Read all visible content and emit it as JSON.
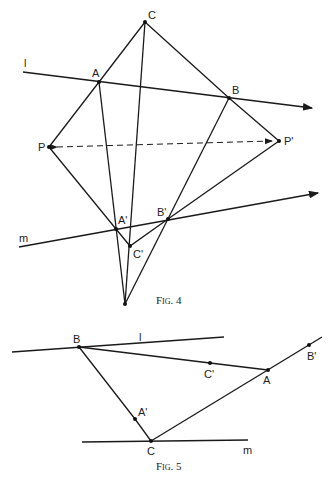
{
  "fig4": {
    "caption": "Fig. 4",
    "points": {
      "C": {
        "label": "C",
        "x": 145,
        "y": 22
      },
      "A": {
        "label": "A",
        "x": 99,
        "y": 82
      },
      "B": {
        "label": "B",
        "x": 229,
        "y": 98
      },
      "P": {
        "label": "P",
        "x": 49,
        "y": 147
      },
      "Pp": {
        "label": "P'",
        "x": 279,
        "y": 141
      },
      "Ap": {
        "label": "A'",
        "x": 116,
        "y": 229
      },
      "Bp": {
        "label": "B'",
        "x": 168,
        "y": 219
      },
      "Cp": {
        "label": "C'",
        "x": 130,
        "y": 246
      },
      "O": {
        "label": "",
        "x": 125,
        "y": 304
      }
    },
    "lines": {
      "l": {
        "label": "l",
        "x1": 23,
        "y1": 72,
        "x2": 312,
        "y2": 108
      },
      "m": {
        "label": "m",
        "x1": 19,
        "y1": 247,
        "x2": 318,
        "y2": 193
      }
    }
  },
  "fig5": {
    "caption": "Fig. 5",
    "points": {
      "B": {
        "label": "B",
        "x": 79,
        "y": 347
      },
      "Cp": {
        "label": "C'",
        "x": 210,
        "y": 363
      },
      "A": {
        "label": "A",
        "x": 268,
        "y": 370
      },
      "Bp": {
        "label": "B'",
        "x": 309,
        "y": 345
      },
      "Ap": {
        "label": "A'",
        "x": 135,
        "y": 419
      },
      "C": {
        "label": "C",
        "x": 151,
        "y": 441
      }
    },
    "lines": {
      "l": {
        "label": "l",
        "x1": 12,
        "y1": 352,
        "x2": 224,
        "y2": 337
      },
      "m": {
        "label": "m",
        "x1": 82,
        "y1": 442,
        "x2": 248,
        "y2": 440
      },
      "ext": {
        "x1": 151,
        "y1": 441,
        "x2": 322,
        "y2": 337
      }
    }
  }
}
